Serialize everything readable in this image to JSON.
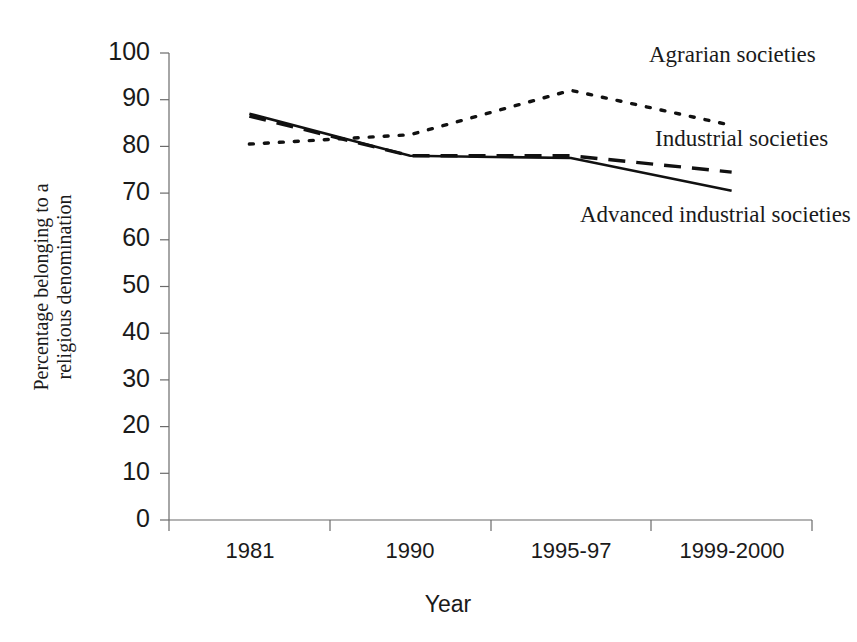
{
  "chart_data": {
    "type": "line",
    "title": "",
    "subtitle": "",
    "xlabel": "Year",
    "ylabel": "Percentage belonging to a religious denomination",
    "ylabel_line1": "Percentage belonging to a",
    "ylabel_line2": "religious denomination",
    "categories": [
      "1981",
      "1990",
      "1995-97",
      "1999-2000"
    ],
    "ylim": [
      0,
      100
    ],
    "ytick_labels": [
      "0",
      "10",
      "20",
      "30",
      "40",
      "50",
      "60",
      "70",
      "80",
      "90",
      "100"
    ],
    "yticks": [
      0,
      10,
      20,
      30,
      40,
      50,
      60,
      70,
      80,
      90,
      100
    ],
    "grid": false,
    "legend_position": "inline-annotations",
    "series": [
      {
        "name": "Agrarian societies",
        "style": "dotted",
        "color": "#111111",
        "values": [
          80.5,
          82.5,
          92.0,
          84.5
        ],
        "annotation": {
          "label": "Agrarian societies",
          "x": 649,
          "y": 62
        }
      },
      {
        "name": "Industrial societies",
        "style": "dashed",
        "color": "#111111",
        "values": [
          86.5,
          78.0,
          78.0,
          74.5
        ],
        "annotation": {
          "label": "Industrial societies",
          "x": 655,
          "y": 146
        }
      },
      {
        "name": "Advanced industrial societies",
        "style": "solid",
        "color": "#111111",
        "values": [
          87.0,
          78.0,
          77.5,
          70.5
        ],
        "annotation": {
          "label": "Advanced industrial societies",
          "x": 580,
          "y": 222
        }
      }
    ]
  },
  "axes": {
    "y_axis_name": "y-axis",
    "x_axis_name": "x-axis"
  }
}
